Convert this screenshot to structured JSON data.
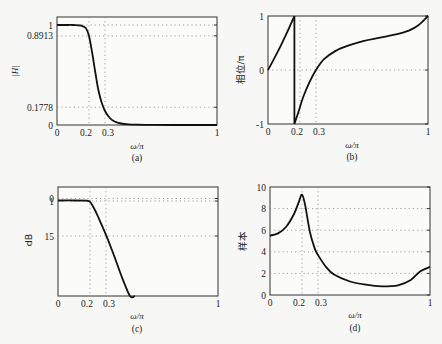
{
  "chart_data": [
    {
      "id": "a",
      "type": "line",
      "caption": "(a)",
      "xlabel": "ω/π",
      "ylabel": "|H|",
      "xlim": [
        0,
        1
      ],
      "ylim": [
        0,
        1.08
      ],
      "xticks": [
        "0",
        "0.2",
        "0.3",
        "1"
      ],
      "xtick_values": [
        0,
        0.2,
        0.3,
        1
      ],
      "yticks": [
        "0",
        "0.1778",
        "0.8913",
        "1"
      ],
      "ytick_values": [
        0,
        0.1778,
        0.8913,
        1
      ],
      "grid": "dotted at tick values",
      "x": [
        0,
        0.05,
        0.1,
        0.15,
        0.18,
        0.2,
        0.22,
        0.24,
        0.26,
        0.28,
        0.3,
        0.33,
        0.36,
        0.4,
        0.45,
        0.5,
        0.6,
        0.8,
        1.0
      ],
      "y": [
        1,
        1,
        1,
        0.995,
        0.97,
        0.89,
        0.72,
        0.52,
        0.34,
        0.22,
        0.14,
        0.07,
        0.035,
        0.015,
        0.006,
        0.003,
        0.001,
        0.0,
        0.0
      ]
    },
    {
      "id": "b",
      "type": "line",
      "caption": "(b)",
      "xlabel": "ω/π",
      "ylabel": "相位/π",
      "xlim": [
        0,
        1
      ],
      "ylim": [
        -1,
        1
      ],
      "xticks": [
        "0",
        "0.2",
        "0.3",
        "1"
      ],
      "xtick_values": [
        0,
        0.2,
        0.3,
        1
      ],
      "yticks": [
        "-1",
        "0",
        "1"
      ],
      "ytick_values": [
        -1,
        0,
        1
      ],
      "grid": "dotted at tick values",
      "segments": [
        {
          "x": [
            0,
            0.04,
            0.08,
            0.12,
            0.165
          ],
          "y": [
            0,
            0.22,
            0.45,
            0.7,
            1.0
          ]
        },
        {
          "x": [
            0.165,
            0.165
          ],
          "y": [
            1.0,
            -1.0
          ]
        },
        {
          "x": [
            0.165,
            0.19,
            0.22,
            0.26,
            0.3,
            0.35,
            0.42,
            0.5,
            0.6,
            0.7,
            0.8,
            0.88,
            0.94,
            1.0
          ],
          "y": [
            -1.0,
            -0.78,
            -0.5,
            -0.22,
            0.0,
            0.2,
            0.35,
            0.45,
            0.54,
            0.6,
            0.66,
            0.73,
            0.83,
            1.0
          ]
        }
      ]
    },
    {
      "id": "c",
      "type": "line",
      "caption": "(c)",
      "xlabel": "ω/π",
      "ylabel": "dB",
      "xlim": [
        0,
        1
      ],
      "ylim_note": "inverted attenuation axis; 0 at top",
      "xticks": [
        "0",
        "0.2",
        "0.3",
        "1"
      ],
      "xtick_values": [
        0,
        0.2,
        0.3,
        1
      ],
      "yticks": [
        "0",
        "1",
        "15"
      ],
      "ytick_values": [
        0,
        1,
        15
      ],
      "grid": "dotted at tick values",
      "x": [
        0,
        0.1,
        0.18,
        0.2,
        0.22,
        0.25,
        0.3,
        0.35,
        0.4,
        0.45,
        0.48
      ],
      "attenuation_db": [
        0.4,
        0.4,
        0.5,
        1.0,
        3.0,
        7.0,
        14.5,
        23,
        32,
        41,
        47
      ]
    },
    {
      "id": "d",
      "type": "line",
      "caption": "(d)",
      "xlabel": "ω/π",
      "ylabel": "样本",
      "xlim": [
        0,
        1
      ],
      "ylim": [
        0,
        10
      ],
      "xticks": [
        "0",
        "0.2",
        "0.3",
        "1"
      ],
      "xtick_values": [
        0,
        0.2,
        0.3,
        1
      ],
      "yticks": [
        "0",
        "2",
        "4",
        "6",
        "8",
        "10"
      ],
      "ytick_values": [
        0,
        2,
        4,
        6,
        8,
        10
      ],
      "grid": "dotted at tick values",
      "x": [
        0,
        0.05,
        0.1,
        0.15,
        0.18,
        0.2,
        0.22,
        0.25,
        0.28,
        0.3,
        0.35,
        0.4,
        0.5,
        0.6,
        0.7,
        0.8,
        0.88,
        0.94,
        1.0
      ],
      "y": [
        5.5,
        5.7,
        6.3,
        7.5,
        8.6,
        9.3,
        8.3,
        5.8,
        4.3,
        3.7,
        2.6,
        1.9,
        1.25,
        0.95,
        0.8,
        0.9,
        1.4,
        2.2,
        2.6
      ]
    }
  ]
}
